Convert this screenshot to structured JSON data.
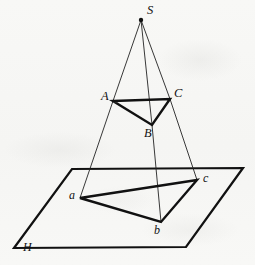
{
  "figure": {
    "kind": "central-projection-geometry-diagram",
    "background_color": "#f7f7f5",
    "ink_color": "#111111",
    "canvas": {
      "width": 255,
      "height": 265
    }
  },
  "points": {
    "S": {
      "label": "S",
      "x": 141,
      "y": 20,
      "label_x": 147,
      "label_y": 10,
      "dot": true,
      "dot_r": 2.2
    },
    "A": {
      "label": "A",
      "x": 113,
      "y": 101,
      "label_x": 101,
      "label_y": 95,
      "dot": false
    },
    "B": {
      "label": "B",
      "x": 152,
      "y": 125,
      "label_x": 144,
      "label_y": 128,
      "dot": false
    },
    "C": {
      "label": "C",
      "x": 170,
      "y": 99,
      "label_x": 174,
      "label_y": 92,
      "dot": false
    },
    "a": {
      "label": "a",
      "x": 80,
      "y": 198,
      "label_x": 70,
      "label_y": 191,
      "dot": false
    },
    "b": {
      "label": "b",
      "x": 161,
      "y": 222,
      "label_x": 155,
      "label_y": 226,
      "dot": false
    },
    "c": {
      "label": "c",
      "x": 197,
      "y": 180,
      "label_x": 203,
      "label_y": 173,
      "dot": false
    },
    "H": {
      "label": "H",
      "x": 14,
      "y": 248,
      "label_x": 23,
      "label_y": 243,
      "dot": false
    }
  },
  "plane": {
    "name": "H",
    "corners": [
      {
        "x": 72,
        "y": 169
      },
      {
        "x": 243,
        "y": 168
      },
      {
        "x": 186,
        "y": 247
      },
      {
        "x": 14,
        "y": 248
      }
    ],
    "stroke_width": 2.2
  },
  "upper_triangle": {
    "name": "ABC",
    "vertices": [
      "A",
      "C",
      "B"
    ],
    "path": "M 113 101 L 170 99 L 152 125 Z",
    "stroke_width": 2.4
  },
  "lower_triangle": {
    "name": "abc",
    "vertices": [
      "a",
      "c",
      "b"
    ],
    "path": "M 80 198 L 197 180 L 161 222 Z",
    "stroke_width": 2.4
  },
  "projection_rays": [
    {
      "name": "ray-S-A-a",
      "from": "S",
      "through": "A",
      "to": "a",
      "path": "M 141 20 L 113 101 L 80 198"
    },
    {
      "name": "ray-S-B-b",
      "from": "S",
      "through": "B",
      "to": "b",
      "path": "M 141 20 L 152 125 L 161 222"
    },
    {
      "name": "ray-S-C-c",
      "from": "S",
      "through": "C",
      "to": "c",
      "path": "M 141 20 L 170 99 L 197 180"
    }
  ],
  "ray_stroke_width": 0.9
}
